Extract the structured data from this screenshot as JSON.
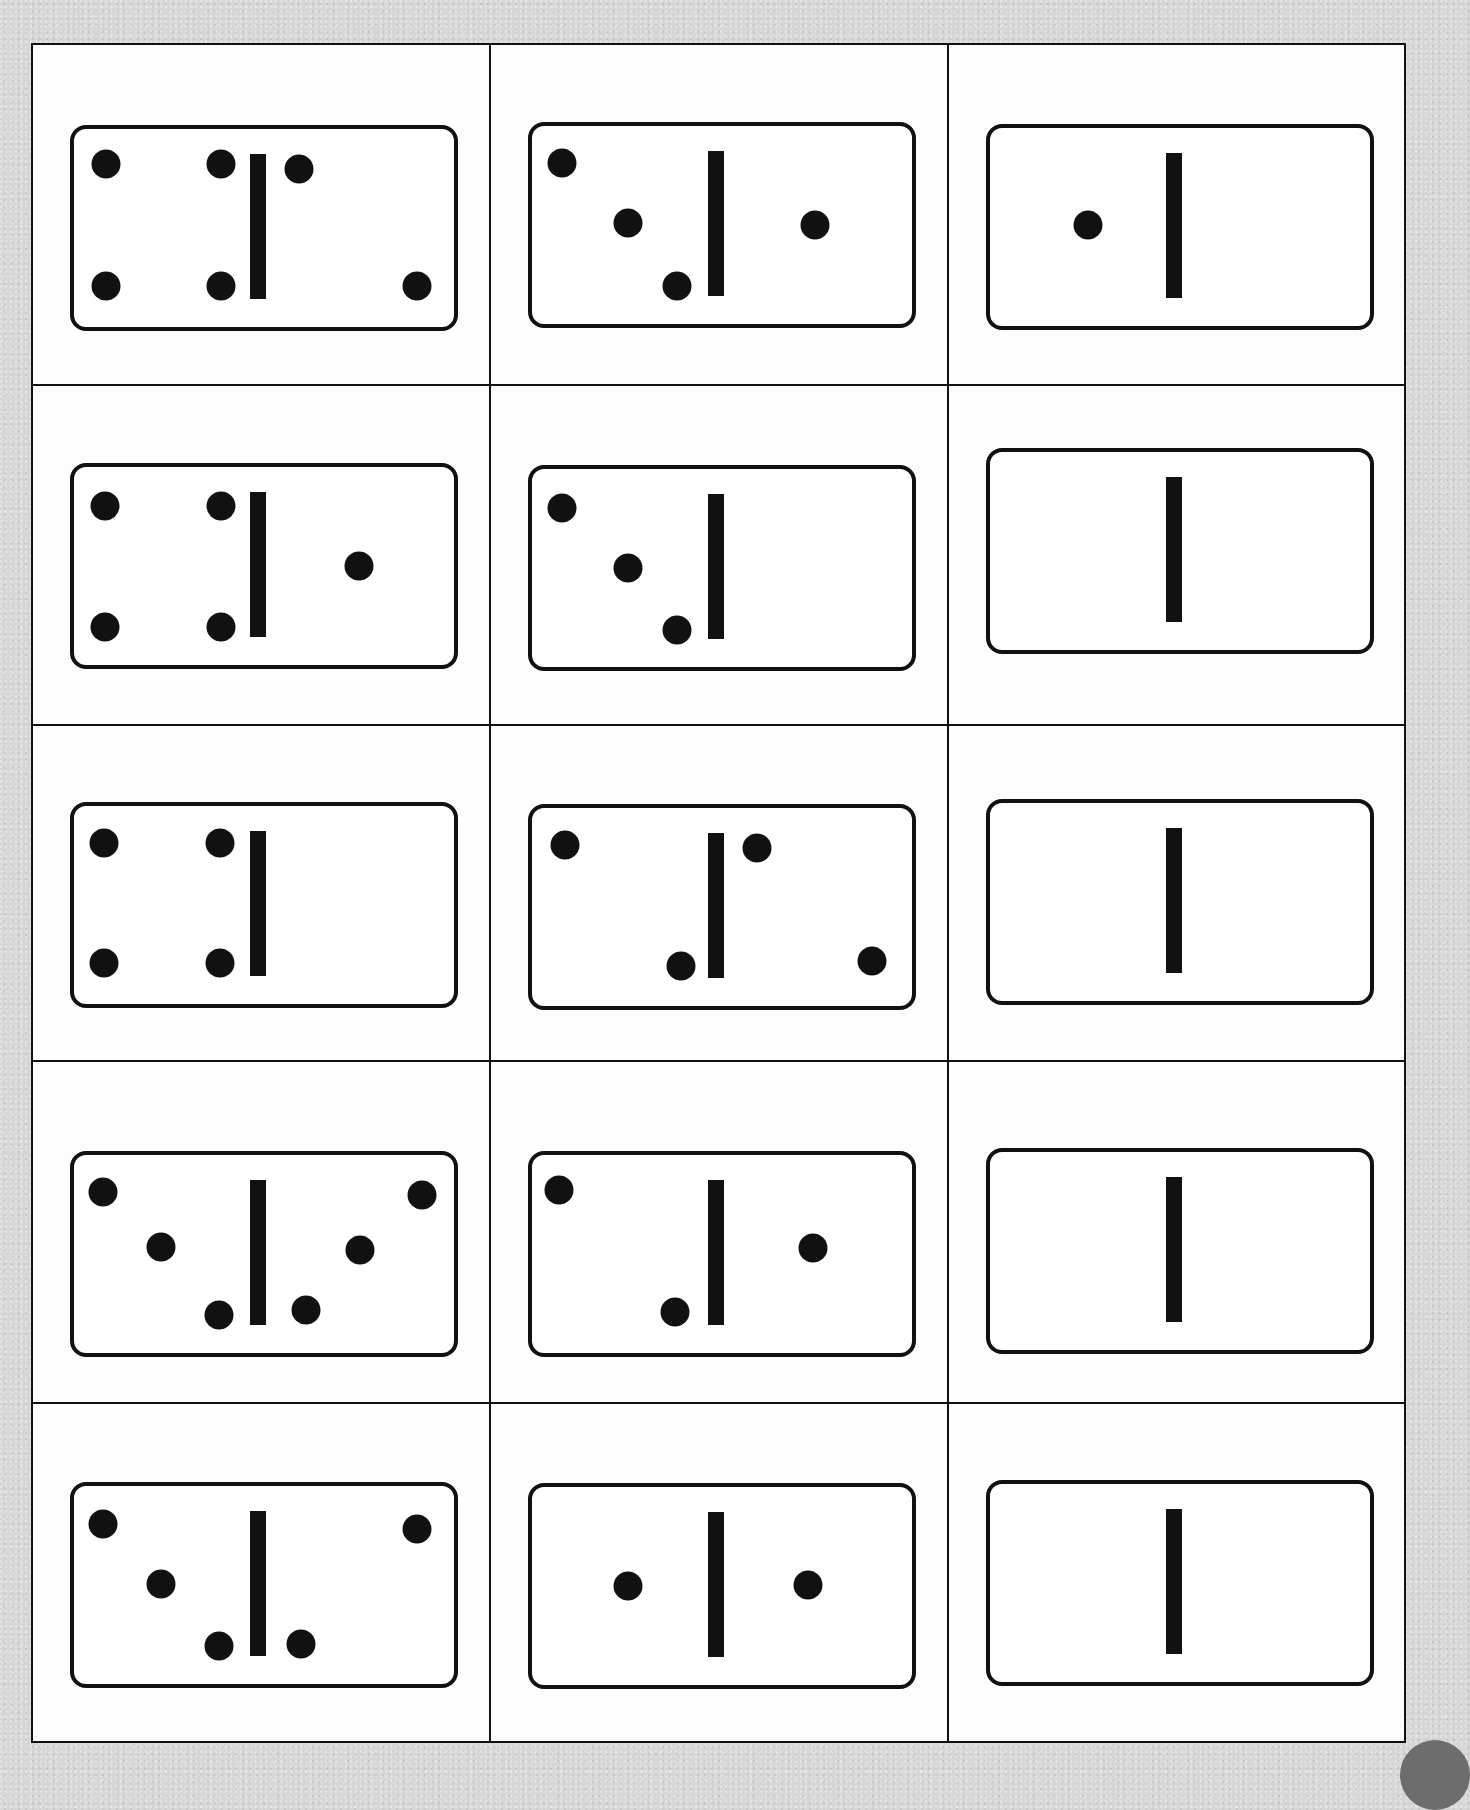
{
  "page": {
    "background_color": "#d6d6d6",
    "card_color": "#fdfdfd",
    "ink_color": "#111111"
  },
  "grid": {
    "rows": 5,
    "cols": 3
  },
  "domino_geometry": {
    "width": 388,
    "height": 206,
    "corner_radius": 14,
    "stroke_width": 4,
    "bar": {
      "x": 180,
      "y": 29,
      "width": 16,
      "height": 145
    },
    "pip_radius": 14.5
  },
  "dominoes": [
    {
      "row": 1,
      "col": 1,
      "left": 4,
      "right": 2,
      "label": "4|2",
      "top": 79,
      "pips": [
        [
          36,
          39
        ],
        [
          151,
          39
        ],
        [
          36,
          161
        ],
        [
          151,
          161
        ],
        [
          229,
          44
        ],
        [
          347,
          161
        ]
      ]
    },
    {
      "row": 1,
      "col": 2,
      "left": 3,
      "right": 1,
      "label": "3|1",
      "top": 76,
      "pips": [
        [
          34,
          41
        ],
        [
          100,
          101
        ],
        [
          149,
          164
        ],
        [
          287,
          103
        ]
      ]
    },
    {
      "row": 1,
      "col": 3,
      "left": 1,
      "right": 0,
      "label": "1|0",
      "top": 78,
      "pips": [
        [
          102,
          101
        ]
      ]
    },
    {
      "row": 2,
      "col": 1,
      "left": 4,
      "right": 1,
      "label": "4|1",
      "top": 76,
      "pips": [
        [
          35,
          43
        ],
        [
          151,
          43
        ],
        [
          35,
          164
        ],
        [
          151,
          164
        ],
        [
          289,
          103
        ]
      ]
    },
    {
      "row": 2,
      "col": 2,
      "left": 3,
      "right": 0,
      "label": "3|0",
      "top": 78,
      "pips": [
        [
          34,
          43
        ],
        [
          100,
          103
        ],
        [
          149,
          165
        ]
      ]
    },
    {
      "row": 2,
      "col": 3,
      "left": 0,
      "right": 0,
      "label": "0|0",
      "top": 61,
      "pips": []
    },
    {
      "row": 3,
      "col": 1,
      "left": 4,
      "right": 0,
      "label": "4|0",
      "top": 75,
      "pips": [
        [
          34,
          41
        ],
        [
          150,
          41
        ],
        [
          34,
          161
        ],
        [
          150,
          161
        ]
      ]
    },
    {
      "row": 3,
      "col": 2,
      "left": 2,
      "right": 2,
      "label": "2|2",
      "top": 77,
      "pips": [
        [
          37,
          41
        ],
        [
          153,
          162
        ],
        [
          229,
          44
        ],
        [
          344,
          157
        ]
      ]
    },
    {
      "row": 3,
      "col": 3,
      "left": 0,
      "right": 0,
      "label": "0|0",
      "top": 72,
      "pips": []
    },
    {
      "row": 4,
      "col": 1,
      "left": 3,
      "right": 3,
      "label": "3|3",
      "top": 88,
      "pips": [
        [
          33,
          41
        ],
        [
          91,
          96
        ],
        [
          149,
          164
        ],
        [
          236,
          159
        ],
        [
          290,
          99
        ],
        [
          352,
          44
        ]
      ]
    },
    {
      "row": 4,
      "col": 2,
      "left": 2,
      "right": 1,
      "label": "2|1",
      "top": 88,
      "pips": [
        [
          31,
          39
        ],
        [
          147,
          161
        ],
        [
          285,
          97
        ]
      ]
    },
    {
      "row": 4,
      "col": 3,
      "left": 0,
      "right": 0,
      "label": "0|0",
      "top": 85,
      "pips": []
    },
    {
      "row": 5,
      "col": 1,
      "left": 3,
      "right": 2,
      "label": "3|2",
      "top": 77,
      "pips": [
        [
          33,
          42
        ],
        [
          91,
          102
        ],
        [
          149,
          164
        ],
        [
          231,
          162
        ],
        [
          347,
          47
        ]
      ]
    },
    {
      "row": 5,
      "col": 2,
      "left": 1,
      "right": 1,
      "label": "1|1",
      "top": 78,
      "pips": [
        [
          100,
          103
        ],
        [
          280,
          102
        ]
      ]
    },
    {
      "row": 5,
      "col": 3,
      "left": 0,
      "right": 0,
      "label": "0|0",
      "top": 75,
      "pips": []
    }
  ]
}
